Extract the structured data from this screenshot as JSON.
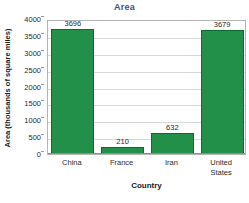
{
  "chart_data": {
    "type": "bar",
    "title": "Area",
    "xlabel": "Country",
    "ylabel": "Area (thousands of square miles)",
    "categories": [
      "China",
      "France",
      "Iran",
      "United States"
    ],
    "category_lines": [
      [
        "China"
      ],
      [
        "France"
      ],
      [
        "Iran"
      ],
      [
        "United",
        "States"
      ]
    ],
    "values": [
      3696,
      210,
      632,
      3679
    ],
    "value_labels": [
      "3696",
      "210",
      "632",
      "3679"
    ],
    "ylim": [
      0,
      4000
    ],
    "yticks": [
      4000,
      3500,
      3000,
      2500,
      2000,
      1500,
      1000,
      500,
      0
    ],
    "ytick_labels": [
      "4000",
      "3500",
      "3000",
      "2500",
      "2000",
      "1500",
      "1000",
      "500",
      "0"
    ],
    "grid": true,
    "legend": false,
    "colors": {
      "bar_fill": "#229049",
      "bar_border": "#0d6b32",
      "title": "#3f4f7d",
      "gridline": "#d8d8d8",
      "plot_border": "#b4b4b4",
      "axis_text": "#2b2b2b",
      "background": "#ffffff"
    }
  }
}
